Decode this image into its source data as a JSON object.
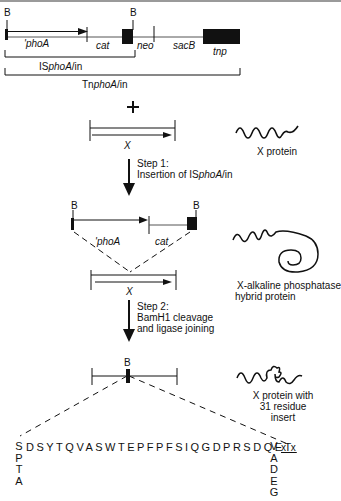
{
  "construct": {
    "bamhi_site_label": "B",
    "genes": {
      "phoA": "'phoA",
      "cat": "cat",
      "neo": "neo",
      "sacB": "sacB",
      "tnp": "tnp"
    },
    "brackets": {
      "isphoa": {
        "prefix": "IS",
        "italic": "phoA",
        "suffix": "/in"
      },
      "tnphoa": {
        "prefix": "Tn",
        "italic": "phoA",
        "suffix": "/in"
      }
    }
  },
  "plus_sign": "+",
  "target_gene": {
    "label": "X"
  },
  "proteins": {
    "x_protein": "X protein",
    "hybrid_line1": "X-alkaline phosphatase",
    "hybrid_line2": "hybrid protein",
    "insert_line1": "X protein with",
    "insert_line2": "31 residue",
    "insert_line3": "insert"
  },
  "steps": {
    "step1": {
      "title": "Step 1:",
      "text_prefix": "Insertion of IS",
      "text_italic": "phoA",
      "text_suffix": "/in"
    },
    "step2": {
      "title": "Step 2:",
      "line2": "BamH1 cleavage",
      "line3": "and ligase joining"
    }
  },
  "insertion_intermediate": {
    "b_label": "B",
    "phoA": "'phoA",
    "cat": "cat",
    "x_label": "X"
  },
  "final_product": {
    "b_label": "B",
    "sequence": "DSYTQVASWTEPFPFSIQGDPRSDQET",
    "first_residue": "S",
    "first_residue_alternatives": [
      "P",
      "T",
      "A"
    ],
    "last_residue": "V",
    "last_residue_alternatives": [
      "A",
      "D",
      "E",
      "G"
    ],
    "trailing": "x x"
  }
}
